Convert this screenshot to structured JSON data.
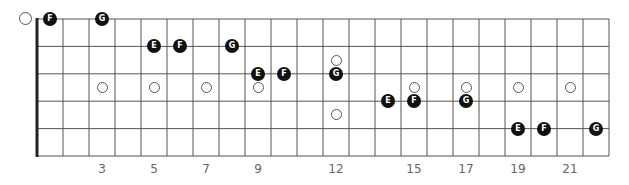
{
  "diagram": {
    "type": "guitar-fretboard",
    "strings": 6,
    "frets": 22,
    "colors": {
      "line": "#555555",
      "nut": "#222222",
      "note_fill": "#111111",
      "note_text": "#ffffff",
      "inlay_stroke": "#555555"
    },
    "fret_numbers": [
      {
        "fret": 3,
        "label": "3"
      },
      {
        "fret": 5,
        "label": "5"
      },
      {
        "fret": 7,
        "label": "7"
      },
      {
        "fret": 9,
        "label": "9"
      },
      {
        "fret": 12,
        "label": "12"
      },
      {
        "fret": 15,
        "label": "15"
      },
      {
        "fret": 17,
        "label": "17"
      },
      {
        "fret": 19,
        "label": "19"
      },
      {
        "fret": 21,
        "label": "21"
      }
    ],
    "inlays": [
      {
        "fret": 3,
        "pos": "mid"
      },
      {
        "fret": 5,
        "pos": "mid"
      },
      {
        "fret": 7,
        "pos": "mid"
      },
      {
        "fret": 9,
        "pos": "mid"
      },
      {
        "fret": 12,
        "pos": "upper"
      },
      {
        "fret": 12,
        "pos": "lower"
      },
      {
        "fret": 15,
        "pos": "mid"
      },
      {
        "fret": 17,
        "pos": "mid"
      },
      {
        "fret": 19,
        "pos": "mid"
      },
      {
        "fret": 21,
        "pos": "mid"
      }
    ],
    "open_markers": [
      {
        "string": 1
      }
    ],
    "notes": [
      {
        "string": 1,
        "fret": 1,
        "label": "F"
      },
      {
        "string": 1,
        "fret": 3,
        "label": "G"
      },
      {
        "string": 2,
        "fret": 5,
        "label": "E"
      },
      {
        "string": 2,
        "fret": 6,
        "label": "F"
      },
      {
        "string": 2,
        "fret": 8,
        "label": "G"
      },
      {
        "string": 3,
        "fret": 9,
        "label": "E"
      },
      {
        "string": 3,
        "fret": 10,
        "label": "F"
      },
      {
        "string": 3,
        "fret": 12,
        "label": "G"
      },
      {
        "string": 4,
        "fret": 14,
        "label": "E"
      },
      {
        "string": 4,
        "fret": 15,
        "label": "F"
      },
      {
        "string": 4,
        "fret": 17,
        "label": "G"
      },
      {
        "string": 5,
        "fret": 19,
        "label": "E"
      },
      {
        "string": 5,
        "fret": 20,
        "label": "F"
      },
      {
        "string": 5,
        "fret": 22,
        "label": "G"
      }
    ]
  }
}
